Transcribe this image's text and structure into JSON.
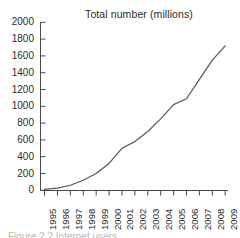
{
  "chart_data": {
    "type": "line",
    "title": "Total number (millions)",
    "xlabel": "",
    "ylabel": "",
    "x": [
      1995,
      1996,
      1997,
      1998,
      1999,
      2000,
      2001,
      2002,
      2003,
      2004,
      2005,
      2006,
      2007,
      2008,
      2009
    ],
    "categories": [
      "1995",
      "1996",
      "1997",
      "1998",
      "1999",
      "2000",
      "2001",
      "2002",
      "2003",
      "2004",
      "2005",
      "2006",
      "2007",
      "2008",
      "2009"
    ],
    "values": [
      10,
      25,
      60,
      120,
      200,
      320,
      500,
      580,
      700,
      850,
      1020,
      1090,
      1320,
      1550,
      1720
    ],
    "series": [
      {
        "name": "Total number (millions)",
        "values": [
          10,
          25,
          60,
          120,
          200,
          320,
          500,
          580,
          700,
          850,
          1020,
          1090,
          1320,
          1550,
          1720
        ]
      }
    ],
    "ylim": [
      0,
      2000
    ],
    "ytick_labels": [
      "0",
      "200",
      "400",
      "600",
      "800",
      "1000",
      "1200",
      "1400",
      "1600",
      "1800",
      "2000"
    ],
    "ytick_values": [
      0,
      200,
      400,
      600,
      800,
      1000,
      1200,
      1400,
      1600,
      1800,
      2000
    ],
    "xlim": [
      1995,
      2009
    ],
    "grid": false,
    "legend": false,
    "legend_position": "none",
    "line_color": "#595959",
    "axis_color": "#4a4a4a",
    "background_color": "#ffffff"
  },
  "caption": {
    "partial_text": "Figure 2.2  Internet users"
  }
}
